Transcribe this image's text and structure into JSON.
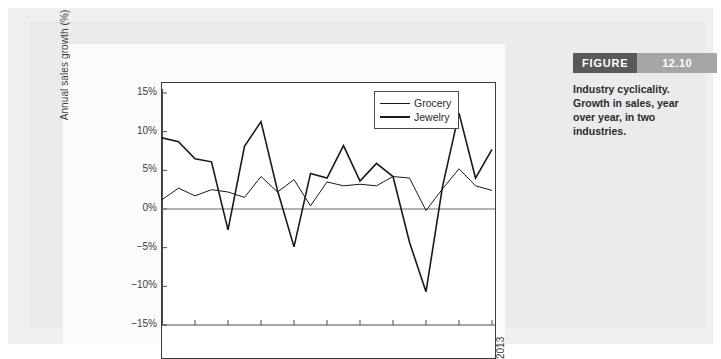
{
  "figure": {
    "tag_label": "FIGURE",
    "tag_number": "12.10",
    "caption": "Industry cyclicality. Growth in sales, year over year, in two industries.",
    "tag_label_color": "#595959",
    "tag_number_color": "#a6a6a6"
  },
  "chart_data": {
    "type": "line",
    "title": "",
    "xlabel": "",
    "ylabel": "Annual sales growth (%)",
    "ylim": [
      -15,
      15
    ],
    "ytick_labels": [
      "15%",
      "10%",
      "5%",
      "0%",
      "−5%",
      "−10%",
      "−15%"
    ],
    "ytick_values": [
      15,
      10,
      5,
      0,
      -5,
      -10,
      -15
    ],
    "grid": false,
    "zero_line": true,
    "legend_position": "top-right",
    "x": [
      1993,
      1994,
      1995,
      1996,
      1997,
      1998,
      1999,
      2000,
      2001,
      2002,
      2003,
      2004,
      2005,
      2006,
      2007,
      2008,
      2009,
      2010,
      2011,
      2012,
      2013
    ],
    "xtick_labels": [
      "1993",
      "1995",
      "1997",
      "1999",
      "2001",
      "2003",
      "2005",
      "2007",
      "2009",
      "2011",
      "2013"
    ],
    "xtick_values": [
      1993,
      1995,
      1997,
      1999,
      2001,
      2003,
      2005,
      2007,
      2009,
      2011,
      2013
    ],
    "series": [
      {
        "name": "Grocery",
        "color": "#1a1a1a",
        "line_width": 1,
        "values": [
          1.2,
          2.7,
          1.7,
          2.5,
          2.2,
          1.5,
          4.2,
          2.2,
          3.8,
          0.4,
          3.5,
          3.0,
          3.2,
          3.0,
          4.2,
          4.0,
          -0.2,
          2.6,
          5.2,
          3.0,
          2.4
        ]
      },
      {
        "name": "Jewelry",
        "color": "#1a1a1a",
        "line_width": 2,
        "values": [
          9.2,
          8.7,
          6.5,
          6.1,
          -2.7,
          8.1,
          11.3,
          2.4,
          -4.9,
          4.6,
          4.0,
          8.2,
          3.6,
          5.9,
          4.2,
          -4.3,
          -10.7,
          2.9,
          12.4,
          4.0,
          7.7
        ]
      }
    ]
  }
}
